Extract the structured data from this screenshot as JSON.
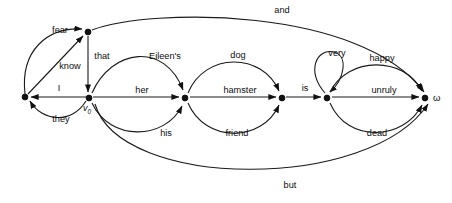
{
  "diagram": {
    "type": "word-lattice",
    "title": "",
    "nodes": [
      {
        "id": "n_left",
        "label": "",
        "x": 25,
        "y": 97
      },
      {
        "id": "n_top",
        "label": "",
        "x": 88,
        "y": 32
      },
      {
        "id": "n_v0",
        "label": "v",
        "sub": "0",
        "x": 89,
        "y": 98
      },
      {
        "id": "n_her",
        "label": "",
        "x": 185,
        "y": 98
      },
      {
        "id": "n_hams",
        "label": "",
        "x": 282,
        "y": 98
      },
      {
        "id": "n_is",
        "label": "",
        "x": 327,
        "y": 98
      },
      {
        "id": "n_omega",
        "label": "ω",
        "x": 425,
        "y": 98
      }
    ],
    "edges": [
      {
        "label": "and",
        "from": "n_top",
        "to": "n_omega",
        "shape": "top-long"
      },
      {
        "label": "fear",
        "from": "n_left",
        "to": "n_top",
        "shape": "arc-up"
      },
      {
        "label": "know",
        "from": "n_left",
        "to": "n_top",
        "shape": "straight"
      },
      {
        "label": "that",
        "from": "n_top",
        "to": "n_v0",
        "shape": "vertical"
      },
      {
        "label": "Eileen's",
        "from": "n_v0",
        "to": "n_her",
        "shape": "arc-up"
      },
      {
        "label": "I",
        "from": "n_v0",
        "to": "n_left",
        "shape": "straight"
      },
      {
        "label": "her",
        "from": "n_v0",
        "to": "n_her",
        "shape": "straight"
      },
      {
        "label": "they",
        "from": "n_v0",
        "to": "n_left",
        "shape": "arc-down"
      },
      {
        "label": "his",
        "from": "n_v0",
        "to": "n_her",
        "shape": "arc-down"
      },
      {
        "label": "dog",
        "from": "n_her",
        "to": "n_hams",
        "shape": "arc-up"
      },
      {
        "label": "hamster",
        "from": "n_her",
        "to": "n_hams",
        "shape": "straight"
      },
      {
        "label": "friend",
        "from": "n_her",
        "to": "n_hams",
        "shape": "arc-down"
      },
      {
        "label": "is",
        "from": "n_hams",
        "to": "n_is",
        "shape": "straight"
      },
      {
        "label": "very",
        "from": "n_is",
        "to": "n_is",
        "shape": "self-loop"
      },
      {
        "label": "happy",
        "from": "n_is",
        "to": "n_omega",
        "shape": "arc-up"
      },
      {
        "label": "unruly",
        "from": "n_is",
        "to": "n_omega",
        "shape": "straight"
      },
      {
        "label": "dead",
        "from": "n_is",
        "to": "n_omega",
        "shape": "arc-down"
      },
      {
        "label": "but",
        "from": "n_v0",
        "to": "n_omega",
        "shape": "bottom-long"
      }
    ],
    "edge_labels": [
      {
        "text": "and",
        "x": 282,
        "y": 13
      },
      {
        "text": "fear",
        "x": 60,
        "y": 33
      },
      {
        "text": "know",
        "x": 70,
        "y": 69
      },
      {
        "text": "that",
        "x": 102,
        "y": 59
      },
      {
        "text": "Eileen's",
        "x": 165,
        "y": 59
      },
      {
        "text": "I",
        "x": 59,
        "y": 91
      },
      {
        "text": "her",
        "x": 142,
        "y": 93
      },
      {
        "text": "they",
        "x": 61,
        "y": 122
      },
      {
        "text": "his",
        "x": 166,
        "y": 136
      },
      {
        "text": "dog",
        "x": 238,
        "y": 58
      },
      {
        "text": "hamster",
        "x": 240,
        "y": 93
      },
      {
        "text": "friend",
        "x": 237,
        "y": 136
      },
      {
        "text": "is",
        "x": 305,
        "y": 91
      },
      {
        "text": "very",
        "x": 337,
        "y": 56
      },
      {
        "text": "happy",
        "x": 382,
        "y": 61
      },
      {
        "text": "unruly",
        "x": 384,
        "y": 93
      },
      {
        "text": "dead",
        "x": 377,
        "y": 136
      },
      {
        "text": "but",
        "x": 290,
        "y": 188
      }
    ],
    "node_labels": [
      {
        "text": "v",
        "sub": "0",
        "x": 85,
        "y": 110
      },
      {
        "text": "ω",
        "x": 433,
        "y": 101
      }
    ],
    "colors": {
      "stroke": "#1a1a1a",
      "node": "#111111",
      "background": "#ffffff",
      "text": "#0d0d0d"
    }
  }
}
